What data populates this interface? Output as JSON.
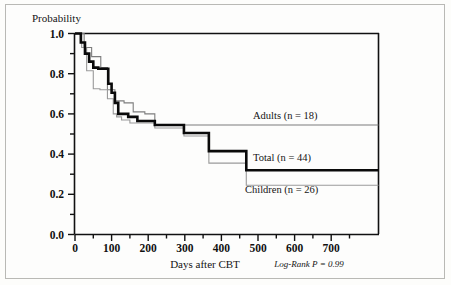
{
  "chart_data": {
    "type": "line",
    "subtype": "kaplan-meier-step",
    "title": "",
    "xlabel": "Days after CBT",
    "ylabel": "Probability",
    "xlim": [
      0,
      730
    ],
    "ylim": [
      0.0,
      1.0
    ],
    "grid": false,
    "legend_position": "inline-right",
    "x_ticks": [
      0,
      100,
      200,
      300,
      400,
      500,
      600,
      700
    ],
    "x_tick_labels": [
      "0",
      "100",
      "200",
      "300",
      "400",
      "500",
      "600",
      "700"
    ],
    "x_minor_ticks": [
      50,
      150,
      250,
      350,
      450,
      550,
      650
    ],
    "y_ticks": [
      0.0,
      0.2,
      0.4,
      0.6,
      0.8,
      1.0
    ],
    "y_tick_labels": [
      "0.0",
      "0.2",
      "0.4",
      "0.6",
      "0.8",
      "1.0"
    ],
    "y_minor_ticks": [
      0.1,
      0.3,
      0.5,
      0.7,
      0.9
    ],
    "annotations": [
      {
        "text": "Log-Rank P = 0.99",
        "italic": true
      }
    ],
    "series": [
      {
        "name": "Adults (n = 18)",
        "label": "Adults (n = 18)",
        "n": 18,
        "color": "#7d7d7d",
        "line_width": 1.1,
        "final_value": 0.545,
        "x": [
          0,
          22,
          22,
          40,
          40,
          62,
          62,
          78,
          78,
          96,
          96,
          100,
          100,
          118,
          118,
          140,
          140,
          168,
          168,
          192,
          192,
          730
        ],
        "y": [
          1.0,
          1.0,
          0.93,
          0.93,
          0.885,
          0.885,
          0.83,
          0.83,
          0.72,
          0.72,
          0.665,
          0.665,
          0.665,
          0.665,
          0.655,
          0.655,
          0.61,
          0.61,
          0.6,
          0.6,
          0.545,
          0.545
        ]
      },
      {
        "name": "Total (n = 44)",
        "label": "Total (n = 44)",
        "n": 44,
        "color": "#0a0a0a",
        "line_width": 2.6,
        "final_value": 0.32,
        "x": [
          0,
          14,
          14,
          24,
          24,
          34,
          34,
          44,
          44,
          56,
          56,
          80,
          80,
          88,
          88,
          96,
          96,
          104,
          104,
          128,
          128,
          150,
          150,
          192,
          192,
          262,
          262,
          322,
          322,
          412,
          412,
          730
        ],
        "y": [
          1.0,
          1.0,
          0.955,
          0.955,
          0.9,
          0.9,
          0.86,
          0.86,
          0.83,
          0.83,
          0.825,
          0.825,
          0.75,
          0.75,
          0.705,
          0.705,
          0.655,
          0.655,
          0.6,
          0.6,
          0.585,
          0.585,
          0.565,
          0.565,
          0.545,
          0.545,
          0.505,
          0.505,
          0.415,
          0.415,
          0.32,
          0.32
        ]
      },
      {
        "name": "Children (n = 26)",
        "label": "Children (n = 26)",
        "n": 26,
        "color": "#9a9a9a",
        "line_width": 1.1,
        "final_value": 0.245,
        "x": [
          0,
          16,
          16,
          28,
          28,
          44,
          44,
          60,
          60,
          78,
          78,
          92,
          92,
          100,
          100,
          112,
          112,
          132,
          132,
          148,
          148,
          192,
          192,
          262,
          262,
          322,
          322,
          412,
          412,
          730
        ],
        "y": [
          1.0,
          1.0,
          0.93,
          0.93,
          0.815,
          0.815,
          0.725,
          0.725,
          0.72,
          0.72,
          0.675,
          0.675,
          0.6,
          0.6,
          0.585,
          0.585,
          0.57,
          0.57,
          0.555,
          0.555,
          0.555,
          0.555,
          0.53,
          0.53,
          0.49,
          0.49,
          0.355,
          0.355,
          0.245,
          0.245
        ]
      }
    ]
  },
  "axes": {
    "y_title": "Probability",
    "x_title": "Days after CBT"
  },
  "stats": {
    "log_rank": "Log-Rank P = 0.99"
  },
  "series_labels": {
    "adults": "Adults (n = 18)",
    "total": "Total (n = 44)",
    "children": "Children (n = 26)"
  },
  "colors": {
    "adults": "#7d7d7d",
    "total": "#0a0a0a",
    "children": "#9a9a9a",
    "axis": "#111111",
    "frame": "#b9b9b5",
    "background": "#fdfdfc"
  }
}
